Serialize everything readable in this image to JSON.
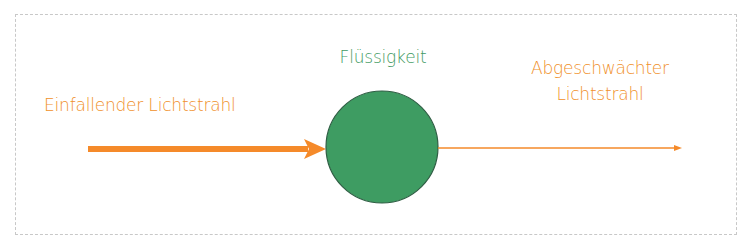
{
  "diagram": {
    "labels": {
      "incident": "Einfallender Lichtstrahl",
      "medium": "Flüssigkeit",
      "attenuated_line1": "Abgeschwächter",
      "attenuated_line2": "Lichtstrahl"
    },
    "colors": {
      "beam": "#f58a2a",
      "label_orange": "#f0902a",
      "liquid_fill": "#3e9c62",
      "liquid_stroke": "#2f5e44",
      "liquid_label": "#3f9a62",
      "frame_border": "#c8c8c8"
    },
    "nodes": [
      {
        "id": "incident-beam",
        "type": "thick-arrow",
        "from": [
          88,
          149
        ],
        "to": [
          323,
          149
        ]
      },
      {
        "id": "liquid",
        "type": "circle",
        "center": [
          382,
          147
        ],
        "radius": 56
      },
      {
        "id": "attenuated-beam",
        "type": "thin-arrow",
        "from": [
          438,
          148
        ],
        "to": [
          681,
          148
        ]
      }
    ]
  }
}
